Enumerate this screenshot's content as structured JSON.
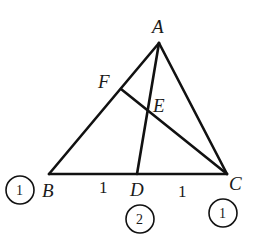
{
  "diagram": {
    "type": "triangle-geometry",
    "points": {
      "A": {
        "label": "A",
        "x": 159,
        "y": 43
      },
      "B": {
        "label": "B",
        "x": 49,
        "y": 174
      },
      "C": {
        "label": "C",
        "x": 227,
        "y": 174
      },
      "D": {
        "label": "D",
        "x": 137,
        "y": 174
      },
      "E": {
        "label": "E",
        "x": 148,
        "y": 112
      },
      "F": {
        "label": "F",
        "x": 121,
        "y": 89
      }
    },
    "segments": [
      "AB",
      "AC",
      "BC",
      "AD",
      "CF"
    ],
    "segment_lengths": {
      "BD": "1",
      "DC": "1"
    },
    "mass_points": {
      "B": "1",
      "D": "2",
      "C": "1"
    }
  }
}
